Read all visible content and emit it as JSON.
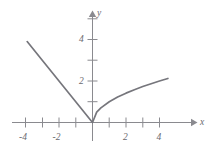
{
  "chart_data": {
    "type": "line",
    "title": "",
    "subtitle": "",
    "xlabel": "x",
    "ylabel": "y",
    "xlim": [
      -4.8,
      5.2
    ],
    "ylim": [
      -0.6,
      5.6
    ],
    "grid": false,
    "legend": null,
    "x_ticks": [
      -4,
      -3,
      -2,
      -1,
      1,
      2,
      3,
      4
    ],
    "x_tick_labels": [
      "-4",
      "",
      "-2",
      "",
      "",
      "2",
      "",
      "4"
    ],
    "x_labeled_ticks": [
      {
        "value": -4,
        "label": "-4"
      },
      {
        "value": -2,
        "label": "-2"
      },
      {
        "value": 2,
        "label": "2"
      },
      {
        "value": 4,
        "label": "4"
      }
    ],
    "y_ticks": [
      1,
      2,
      3,
      4,
      5
    ],
    "y_labeled_ticks": [
      {
        "value": 2,
        "label": "2"
      },
      {
        "value": 4,
        "label": "4"
      }
    ],
    "curve_color": "#76767c",
    "axis_color": "#8a8a8f",
    "series": [
      {
        "name": "left-branch-linear",
        "description": "straight line y = -x for x <= 0",
        "x": [
          -3.9,
          -3.0,
          -2.0,
          -1.0,
          0.0
        ],
        "values": [
          3.9,
          3.0,
          2.0,
          1.0,
          0.0
        ]
      },
      {
        "name": "right-branch-sqrt",
        "description": "square root curve y = sqrt(x) for x >= 0",
        "x": [
          0.0,
          0.25,
          0.5,
          1.0,
          1.5,
          2.0,
          2.5,
          3.0,
          3.5,
          4.0,
          4.5
        ],
        "values": [
          0.0,
          0.5,
          0.707,
          1.0,
          1.225,
          1.414,
          1.581,
          1.732,
          1.871,
          2.0,
          2.121
        ]
      }
    ]
  },
  "axes": {
    "x_axis_label": "x",
    "y_axis_label": "y"
  },
  "labels": {
    "x_neg4": "-4",
    "x_neg2": "-2",
    "x_pos2": "2",
    "x_pos4": "4",
    "y_2": "2",
    "y_4": "4"
  }
}
